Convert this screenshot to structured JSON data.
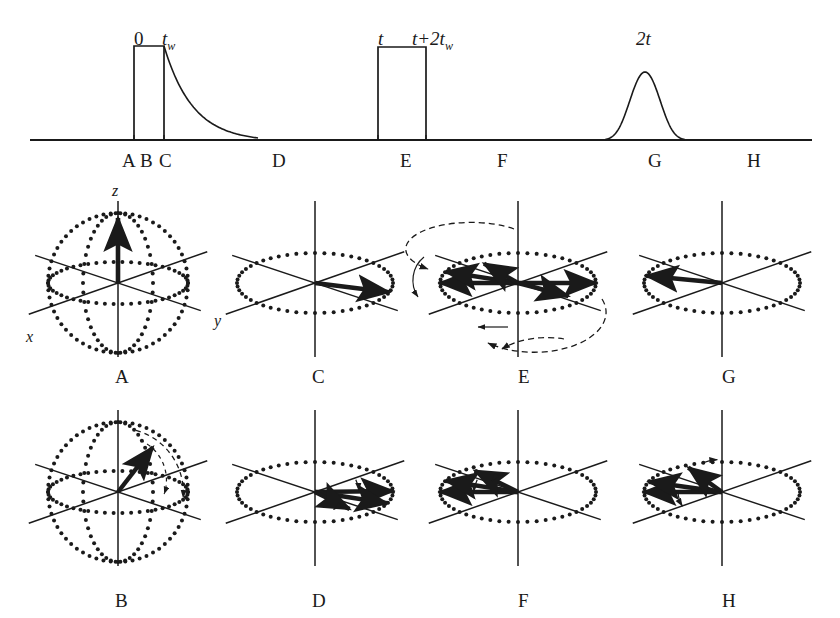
{
  "figure": {
    "title_semantic": "spin-echo-pulse-sequence-and-vector-diagrams",
    "background_color": "#ffffff",
    "stroke_color": "#1a1a1a",
    "width": 840,
    "height": 618
  },
  "sequence": {
    "baseline_y": 140,
    "baseline_x0": 30,
    "baseline_x1": 812,
    "time_labels": [
      {
        "id": "t0",
        "text": "0",
        "x": 134,
        "y": 28,
        "italic": false
      },
      {
        "id": "tw",
        "text": "tw",
        "x": 162,
        "y": 28,
        "italic": true,
        "base": "t",
        "sub": "w"
      },
      {
        "id": "t",
        "text": "t",
        "x": 378,
        "y": 28,
        "italic": true
      },
      {
        "id": "t2tw",
        "text": "t+2tw",
        "x": 412,
        "y": 28,
        "italic": true,
        "base": "t+2t",
        "sub": "w"
      },
      {
        "id": "twot",
        "text": "2t",
        "x": 636,
        "y": 28,
        "italic": true
      }
    ],
    "pulses": [
      {
        "id": "pulse-90",
        "x": 134,
        "width": 30,
        "top_y": 46,
        "label": "90-degree-pulse"
      },
      {
        "id": "pulse-180",
        "x": 378,
        "width": 48,
        "top_y": 47,
        "label": "180-degree-pulse"
      }
    ],
    "fid": {
      "id": "free-induction-decay",
      "start_x": 164,
      "start_y": 46,
      "end_x": 258,
      "end_y": 138
    },
    "echo": {
      "id": "spin-echo",
      "center_x": 645,
      "peak_y": 72,
      "half_width": 40
    },
    "point_labels": [
      {
        "text": "A",
        "x": 122,
        "y": 150
      },
      {
        "text": "B",
        "x": 140,
        "y": 150
      },
      {
        "text": "C",
        "x": 159,
        "y": 150
      },
      {
        "text": "D",
        "x": 272,
        "y": 150
      },
      {
        "text": "E",
        "x": 400,
        "y": 150
      },
      {
        "text": "F",
        "x": 497,
        "y": 150
      },
      {
        "text": "G",
        "x": 648,
        "y": 150
      },
      {
        "text": "H",
        "x": 747,
        "y": 150
      }
    ],
    "tick_marks": [
      {
        "x": 134
      },
      {
        "x": 164
      },
      {
        "x": 378
      },
      {
        "x": 426
      }
    ]
  },
  "axis_labels": {
    "z": {
      "text": "z",
      "x": 112,
      "y": 182
    },
    "y": {
      "text": "y",
      "x": 214,
      "y": 312
    },
    "x": {
      "text": "x",
      "x": 26,
      "y": 328
    }
  },
  "panels": [
    {
      "id": "A",
      "label": "A",
      "label_x": 115,
      "label_y": 366,
      "cx": 118,
      "cy": 283,
      "kind": "sphere",
      "description": "equilibrium-magnetization-along-z",
      "show_sphere": true,
      "show_z_axis_label": true,
      "vectors": [
        {
          "angle_deg": 90,
          "length": 1.0,
          "type": "z-up"
        }
      ],
      "arcs": []
    },
    {
      "id": "B",
      "label": "B",
      "label_x": 115,
      "label_y": 590,
      "cx": 118,
      "cy": 492,
      "kind": "sphere",
      "description": "magnetization-nutating-from-z-toward-y",
      "show_sphere": true,
      "show_z_axis_label": false,
      "vectors": [
        {
          "angle_deg": 48,
          "length": 0.96,
          "type": "tilted"
        }
      ],
      "arcs": [
        {
          "type": "nutation-arc",
          "from_deg": 88,
          "to_deg": 8
        }
      ]
    },
    {
      "id": "C",
      "label": "C",
      "label_x": 312,
      "label_y": 366,
      "cx": 315,
      "cy": 283,
      "kind": "plane",
      "description": "magnetization-in-transverse-plane-along-y",
      "show_sphere": false,
      "vectors": [
        {
          "angle_deg": -18,
          "length": 1.0,
          "type": "in-plane"
        }
      ],
      "arcs": []
    },
    {
      "id": "D",
      "label": "D",
      "label_x": 312,
      "label_y": 590,
      "cx": 315,
      "cy": 492,
      "kind": "plane",
      "description": "isochromats-dephasing-fanning-out",
      "show_sphere": false,
      "vectors": [
        {
          "angle_deg": 2,
          "length": 1.0,
          "type": "in-plane"
        },
        {
          "angle_deg": -22,
          "length": 1.0,
          "type": "in-plane"
        },
        {
          "angle_deg": -52,
          "length": 0.72,
          "type": "in-plane"
        }
      ],
      "arcs": [
        {
          "type": "fan-arc",
          "from_deg": 22,
          "to_deg": 2
        },
        {
          "type": "fan-arc-small",
          "from_deg": -30,
          "to_deg": -52
        }
      ]
    },
    {
      "id": "E",
      "label": "E",
      "label_x": 518,
      "label_y": 366,
      "cx": 518,
      "cy": 283,
      "kind": "plane-flip",
      "description": "180-degree-pulse-flips-isochromats-about-x",
      "show_sphere": false,
      "vectors": [
        {
          "angle_deg": 180,
          "length": 1.0,
          "type": "in-plane"
        },
        {
          "angle_deg": 158,
          "length": 1.0,
          "type": "in-plane"
        },
        {
          "angle_deg": 124,
          "length": 0.78,
          "type": "in-plane"
        },
        {
          "angle_deg": 0,
          "length": 1.0,
          "type": "in-plane"
        },
        {
          "angle_deg": -34,
          "length": 0.78,
          "type": "in-plane"
        }
      ],
      "arcs": [
        {
          "type": "flip-arc-upper"
        },
        {
          "type": "flip-arc-lower"
        },
        {
          "type": "flip-arc-left"
        },
        {
          "type": "flip-arc-right"
        }
      ]
    },
    {
      "id": "F",
      "label": "F",
      "label_x": 518,
      "label_y": 590,
      "cx": 518,
      "cy": 492,
      "kind": "plane",
      "description": "isochromats-rephasing-converging",
      "show_sphere": false,
      "vectors": [
        {
          "angle_deg": 180,
          "length": 1.0,
          "type": "in-plane"
        },
        {
          "angle_deg": 158,
          "length": 1.0,
          "type": "in-plane"
        },
        {
          "angle_deg": 128,
          "length": 0.9,
          "type": "in-plane"
        }
      ],
      "arcs": [
        {
          "type": "fan-arc",
          "from_deg": 158,
          "to_deg": 180
        },
        {
          "type": "fan-arc-small",
          "from_deg": 128,
          "to_deg": 150
        }
      ]
    },
    {
      "id": "G",
      "label": "G",
      "label_x": 722,
      "label_y": 366,
      "cx": 722,
      "cy": 283,
      "kind": "plane",
      "description": "echo-maximum-all-isochromats-refocused",
      "show_sphere": false,
      "vectors": [
        {
          "angle_deg": 166,
          "length": 1.0,
          "type": "in-plane"
        }
      ],
      "arcs": []
    },
    {
      "id": "H",
      "label": "H",
      "label_x": 722,
      "label_y": 590,
      "cx": 722,
      "cy": 492,
      "kind": "plane",
      "description": "isochromats-dephasing-again-after-echo",
      "show_sphere": false,
      "vectors": [
        {
          "angle_deg": 180,
          "length": 1.0,
          "type": "in-plane"
        },
        {
          "angle_deg": 160,
          "length": 1.0,
          "type": "in-plane"
        },
        {
          "angle_deg": 118,
          "length": 0.92,
          "type": "in-plane"
        }
      ],
      "arcs": [
        {
          "type": "fan-arc-down",
          "from_deg": 180,
          "to_deg": 206
        },
        {
          "type": "fan-arc-top",
          "from_deg": 118,
          "to_deg": 96
        }
      ]
    }
  ]
}
